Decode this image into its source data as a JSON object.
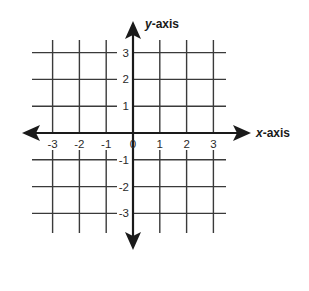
{
  "diagram": {
    "type": "cartesian-coordinate-plane",
    "x_axis": {
      "label_var": "x",
      "label_rest": "-axis",
      "ticks": [
        -3,
        -2,
        -1,
        0,
        1,
        2,
        3
      ],
      "tick_labels": [
        "-3",
        "-2",
        "-1",
        "0",
        "1",
        "2",
        "3"
      ]
    },
    "y_axis": {
      "label_var": "y",
      "label_rest": "-axis",
      "ticks": [
        -3,
        -2,
        -1,
        1,
        2,
        3
      ],
      "tick_labels": [
        "-3",
        "-2",
        "-1",
        "1",
        "2",
        "3"
      ]
    },
    "grid": true,
    "range": {
      "x": [
        -3,
        3
      ],
      "y": [
        -3,
        3
      ]
    },
    "colors": {
      "lines": "#3a3a3a",
      "axes": "#1a1a1a",
      "background": "#ffffff"
    }
  }
}
